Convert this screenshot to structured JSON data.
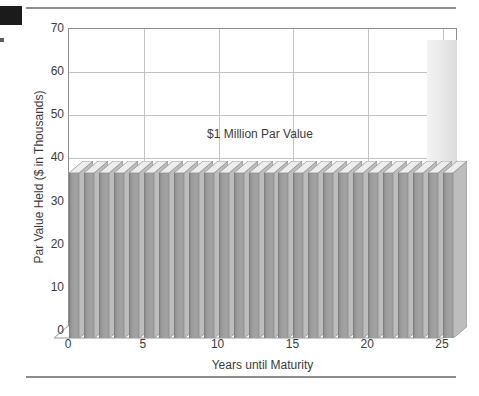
{
  "figure": {
    "page_marker": "black-corner-mark",
    "rule_top": "horizontal-rule",
    "rule_bottom": "horizontal-rule"
  },
  "chart_data": {
    "type": "bar",
    "style": "3d-column",
    "title": "",
    "subtitle": "",
    "xlabel": "Years until Maturity",
    "ylabel": "Par Value Held ($ in Thousands)",
    "annotations": [
      {
        "text": "$1 Million Par Value",
        "x": 12.5,
        "y": 42
      }
    ],
    "xlim": [
      0,
      26
    ],
    "ylim": [
      0,
      70
    ],
    "xticks": [
      0,
      5,
      10,
      15,
      20,
      25
    ],
    "xtick_labels": [
      "0",
      "5",
      "10",
      "15",
      "20",
      "25"
    ],
    "yticks": [
      0,
      10,
      20,
      30,
      40,
      50,
      60,
      70
    ],
    "ytick_labels": [
      "0",
      "10",
      "20",
      "30",
      "40",
      "50",
      "60",
      "70"
    ],
    "grid": {
      "horizontal": true,
      "vertical": true,
      "color": "#c2c2c2"
    },
    "legend": {
      "visible": false,
      "position": "none"
    },
    "categories": [
      0,
      1,
      2,
      3,
      4,
      5,
      6,
      7,
      8,
      9,
      10,
      11,
      12,
      13,
      14,
      15,
      16,
      17,
      18,
      19,
      20,
      21,
      22,
      23,
      24,
      25
    ],
    "values": [
      36.5,
      36.5,
      36.5,
      36.5,
      36.5,
      36.5,
      36.5,
      36.5,
      36.5,
      36.5,
      36.5,
      36.5,
      36.5,
      36.5,
      36.5,
      36.5,
      36.5,
      36.5,
      36.5,
      36.5,
      36.5,
      36.5,
      36.5,
      36.5,
      36.5,
      36.5
    ],
    "series": [
      {
        "name": "Par Value Held",
        "values": [
          36.5,
          36.5,
          36.5,
          36.5,
          36.5,
          36.5,
          36.5,
          36.5,
          36.5,
          36.5,
          36.5,
          36.5,
          36.5,
          36.5,
          36.5,
          36.5,
          36.5,
          36.5,
          36.5,
          36.5,
          36.5,
          36.5,
          36.5,
          36.5,
          36.5,
          36.5
        ],
        "color": "#9c9c9c",
        "side_color": "#bdbdbd",
        "top_color": "#ededed"
      }
    ]
  },
  "colors": {
    "bar_face": "#9c9c9c",
    "bar_side": "#bdbdbd",
    "bar_top": "#ededed",
    "grid": "#c2c2c2",
    "axis": "#8f8f8f",
    "text": "#3b3b3b",
    "rule": "#8d8d8d",
    "marker": "#1b1b1b"
  }
}
